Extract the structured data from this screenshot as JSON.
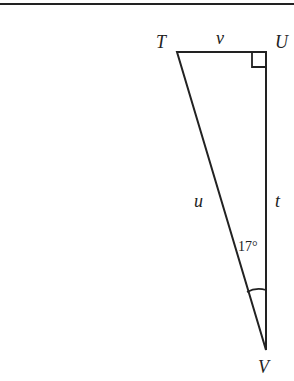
{
  "diagram": {
    "type": "right-triangle",
    "vertices": [
      {
        "id": "T",
        "label": "T"
      },
      {
        "id": "U",
        "label": "U"
      },
      {
        "id": "V",
        "label": "V"
      }
    ],
    "sides": [
      {
        "between": [
          "T",
          "U"
        ],
        "label": "v"
      },
      {
        "between": [
          "T",
          "V"
        ],
        "label": "u"
      },
      {
        "between": [
          "U",
          "V"
        ],
        "label": "t"
      }
    ],
    "right_angle_at": "U",
    "angle": {
      "at": "V",
      "label": "17°"
    }
  }
}
